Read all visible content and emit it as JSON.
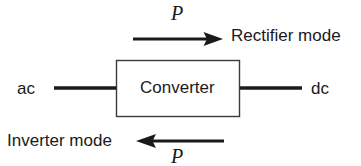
{
  "figure": {
    "background_color": "#ffffff",
    "stroke_color": "#1a1a1a",
    "box": {
      "label": "Converter"
    },
    "terminals": {
      "left_label": "ac",
      "right_label": "dc"
    },
    "flows": [
      {
        "name": "rectifier",
        "power_symbol": "P",
        "mode_label": "Rectifier mode",
        "direction": "right"
      },
      {
        "name": "inverter",
        "power_symbol": "P",
        "mode_label": "Inverter mode",
        "direction": "left"
      }
    ]
  }
}
